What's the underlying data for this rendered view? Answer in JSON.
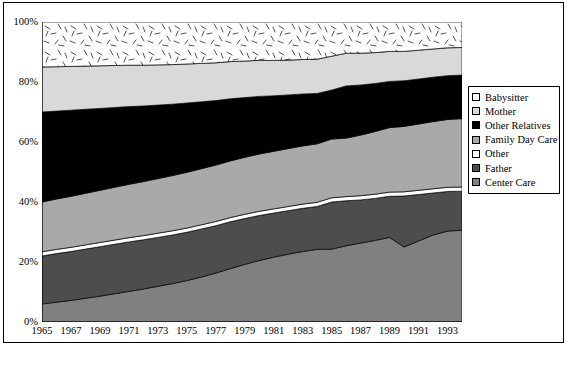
{
  "chart_data": {
    "type": "area",
    "stacked": true,
    "title": "",
    "subtitle": "",
    "xlabel": "",
    "ylabel": "",
    "xlim": [
      1965,
      1994
    ],
    "ylim": [
      0,
      100
    ],
    "grid": false,
    "legend_position": "right",
    "y_ticks": [
      "0%",
      "20%",
      "40%",
      "60%",
      "80%",
      "100%"
    ],
    "y_tick_values": [
      0,
      20,
      40,
      60,
      80,
      100
    ],
    "x_ticks": [
      "1965",
      "1967",
      "1969",
      "1971",
      "1973",
      "1975",
      "1977",
      "1979",
      "1981",
      "1983",
      "1985",
      "1987",
      "1989",
      "1991",
      "1993"
    ],
    "x_tick_values": [
      1965,
      1967,
      1969,
      1971,
      1973,
      1975,
      1977,
      1979,
      1981,
      1983,
      1985,
      1987,
      1989,
      1991,
      1993
    ],
    "x_minor_tick_values": [
      1965,
      1966,
      1967,
      1968,
      1969,
      1970,
      1971,
      1972,
      1973,
      1974,
      1975,
      1976,
      1977,
      1978,
      1979,
      1980,
      1981,
      1982,
      1983,
      1984,
      1985,
      1986,
      1987,
      1988,
      1989,
      1990,
      1991,
      1992,
      1993,
      1994
    ],
    "x": [
      1965,
      1966,
      1967,
      1968,
      1969,
      1970,
      1971,
      1972,
      1973,
      1974,
      1975,
      1976,
      1977,
      1978,
      1979,
      1980,
      1981,
      1982,
      1983,
      1984,
      1985,
      1986,
      1987,
      1988,
      1989,
      1990,
      1991,
      1992,
      1993,
      1994
    ],
    "stack_order_bottom_to_top": [
      "Center Care",
      "Father",
      "Other",
      "Family Day Care",
      "Other Relatives",
      "Mother",
      "Babysitter"
    ],
    "series": [
      {
        "name": "Center Care",
        "color": "#808080",
        "pattern": "solid",
        "values": [
          6.0,
          6.6,
          7.2,
          7.9,
          8.6,
          9.4,
          10.2,
          11.0,
          11.9,
          12.8,
          13.8,
          15.0,
          16.3,
          17.8,
          19.2,
          20.5,
          21.6,
          22.6,
          23.5,
          24.2,
          24.3,
          25.4,
          26.3,
          27.2,
          28.2,
          25.0,
          27.0,
          29.0,
          30.3,
          30.6
        ]
      },
      {
        "name": "Father",
        "color": "#4d4d4d",
        "pattern": "solid",
        "values": [
          16.0,
          16.2,
          16.3,
          16.4,
          16.5,
          16.5,
          16.5,
          16.4,
          16.3,
          16.2,
          16.1,
          16.0,
          15.8,
          15.6,
          15.3,
          15.0,
          14.7,
          14.5,
          14.4,
          14.3,
          15.7,
          15.0,
          14.4,
          14.0,
          13.7,
          17.0,
          15.5,
          14.0,
          13.2,
          13.0
        ]
      },
      {
        "name": "Other",
        "color": "#ffffff",
        "pattern": "solid",
        "values": [
          1.4,
          1.4,
          1.4,
          1.4,
          1.4,
          1.4,
          1.4,
          1.4,
          1.4,
          1.4,
          1.4,
          1.4,
          1.4,
          1.4,
          1.4,
          1.4,
          1.4,
          1.4,
          1.4,
          1.4,
          1.4,
          1.4,
          1.4,
          1.4,
          1.4,
          1.4,
          1.4,
          1.4,
          1.4,
          1.4
        ]
      },
      {
        "name": "Family Day Care",
        "color": "#a9a9a9",
        "pattern": "solid",
        "values": [
          16.6,
          16.8,
          17.0,
          17.2,
          17.4,
          17.6,
          17.8,
          18.0,
          18.2,
          18.4,
          18.6,
          18.7,
          18.8,
          18.9,
          19.0,
          19.1,
          19.2,
          19.3,
          19.4,
          19.5,
          19.6,
          19.5,
          20.2,
          20.9,
          21.5,
          21.8,
          22.1,
          22.4,
          22.6,
          22.8
        ]
      },
      {
        "name": "Other Relatives",
        "color": "#000000",
        "pattern": "solid",
        "values": [
          30.0,
          29.3,
          28.7,
          28.0,
          27.3,
          26.6,
          25.9,
          25.2,
          24.5,
          23.8,
          23.1,
          22.3,
          21.5,
          20.7,
          19.9,
          19.2,
          18.5,
          17.9,
          17.3,
          16.8,
          16.3,
          17.4,
          16.7,
          16.0,
          15.4,
          15.2,
          15.0,
          14.8,
          14.6,
          14.5
        ]
      },
      {
        "name": "Mother",
        "color": "#d9d9d9",
        "pattern": "solid",
        "values": [
          15.0,
          14.8,
          14.6,
          14.4,
          14.2,
          14.0,
          13.8,
          13.6,
          13.4,
          13.2,
          13.0,
          12.8,
          12.6,
          12.4,
          12.2,
          12.0,
          11.8,
          11.6,
          11.5,
          11.4,
          11.3,
          10.9,
          10.6,
          10.3,
          10.0,
          9.8,
          9.6,
          9.4,
          9.3,
          9.2
        ]
      },
      {
        "name": "Babysitter",
        "color": "#ffffff",
        "pattern": "speckle",
        "values": [
          15.0,
          14.9,
          14.8,
          14.7,
          14.6,
          14.5,
          14.4,
          14.4,
          14.3,
          14.2,
          14.0,
          13.8,
          13.6,
          13.2,
          13.0,
          12.8,
          12.8,
          12.7,
          12.5,
          12.4,
          11.4,
          10.4,
          10.4,
          10.2,
          9.8,
          9.8,
          9.4,
          9.0,
          8.6,
          8.5
        ]
      }
    ],
    "legend_entries": [
      {
        "label": "Babysitter",
        "color": "#ffffff",
        "pattern": "speckle"
      },
      {
        "label": "Mother",
        "color": "#d9d9d9",
        "pattern": "solid"
      },
      {
        "label": "Other Relatives",
        "color": "#000000",
        "pattern": "solid"
      },
      {
        "label": "Family Day Care",
        "color": "#a9a9a9",
        "pattern": "solid"
      },
      {
        "label": "Other",
        "color": "#ffffff",
        "pattern": "solid"
      },
      {
        "label": "Father",
        "color": "#4d4d4d",
        "pattern": "solid"
      },
      {
        "label": "Center Care",
        "color": "#808080",
        "pattern": "solid"
      }
    ]
  }
}
